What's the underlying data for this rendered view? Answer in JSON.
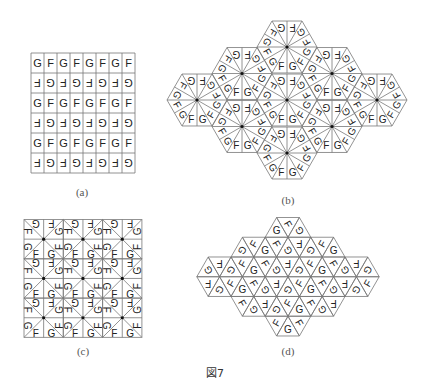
{
  "figure": {
    "caption": "図7",
    "panels": [
      {
        "id": "a",
        "label": "(a)",
        "kind": "square-grid",
        "cols": 8,
        "rows": 6,
        "row_text": [
          "G",
          "F",
          "G",
          "F",
          "G",
          "F",
          "G",
          "F"
        ],
        "alternate_rows_rotated_180": true
      },
      {
        "id": "b",
        "label": "(b)",
        "kind": "hexagon-rosettes",
        "hexagon_count": 9,
        "pair_letters": [
          "F",
          "G"
        ],
        "triangles_per_hexagon": 12,
        "center_dots": true
      },
      {
        "id": "c",
        "label": "(c)",
        "kind": "square-pinwheels",
        "blocks": [
          3,
          3
        ],
        "pair_letters": [
          "F",
          "G"
        ],
        "triangles_per_block": 8,
        "center_dots": true
      },
      {
        "id": "d",
        "label": "(d)",
        "kind": "triangle-tiling",
        "row_triangle_counts": [
          3,
          9,
          15,
          15,
          9,
          3
        ],
        "letters": [
          "F",
          "G"
        ]
      }
    ]
  },
  "colors": {
    "line": "#777777",
    "text": "#222222",
    "dot": "#111111"
  }
}
